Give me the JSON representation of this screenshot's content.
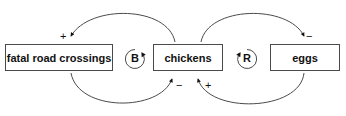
{
  "diagram": {
    "type": "causal-loop-diagram",
    "background_color": "#ffffff",
    "stroke_color": "#4a4a4a",
    "text_color": "#111111",
    "nodes": [
      {
        "id": "fatal-road-crossings",
        "label": "fatal road crossings"
      },
      {
        "id": "chickens",
        "label": "chickens"
      },
      {
        "id": "eggs",
        "label": "eggs"
      }
    ],
    "loops": [
      {
        "id": "balancing",
        "letter": "B",
        "direction": "clockwise"
      },
      {
        "id": "reinforcing",
        "letter": "R",
        "direction": "counter-clockwise"
      }
    ],
    "links": [
      {
        "id": "chickens-to-fatal-road-crossings",
        "from": "chickens",
        "to": "fatal-road-crossings",
        "polarity": "+"
      },
      {
        "id": "fatal-road-crossings-to-chickens",
        "from": "fatal-road-crossings",
        "to": "chickens",
        "polarity": "−"
      },
      {
        "id": "chickens-to-eggs",
        "from": "chickens",
        "to": "eggs",
        "polarity": "−"
      },
      {
        "id": "eggs-to-chickens",
        "from": "eggs",
        "to": "chickens",
        "polarity": "+"
      }
    ]
  }
}
